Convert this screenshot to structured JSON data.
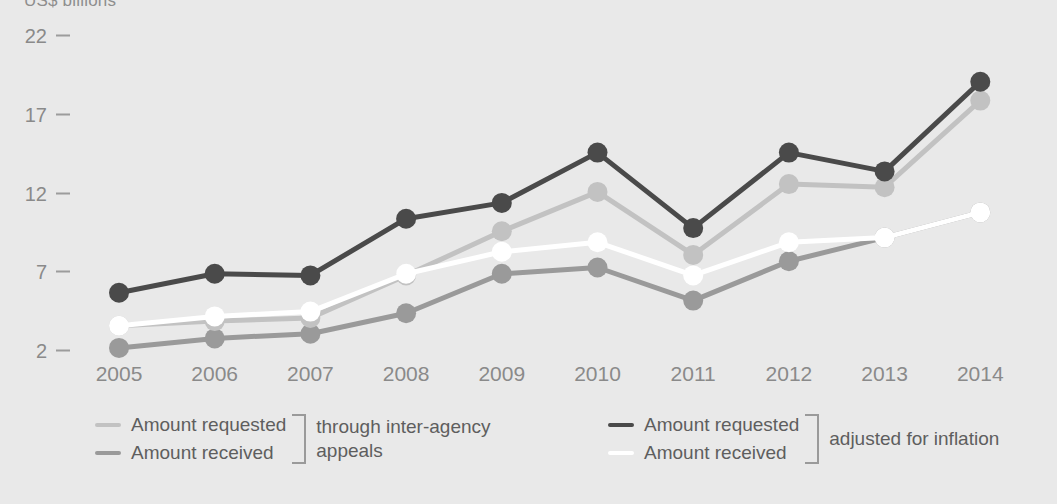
{
  "chart_data": {
    "type": "line",
    "title": "US$ billions",
    "xlabel": "",
    "ylabel": "US$ billions",
    "categories": [
      "2005",
      "2006",
      "2007",
      "2008",
      "2009",
      "2010",
      "2011",
      "2012",
      "2013",
      "2014"
    ],
    "x": [
      2005,
      2006,
      2007,
      2008,
      2009,
      2010,
      2011,
      2012,
      2013,
      2014
    ],
    "yticks": [
      2,
      7,
      12,
      17,
      22
    ],
    "ylim": [
      1.2,
      22.8
    ],
    "grid": false,
    "legend_position": "bottom",
    "series": [
      {
        "name": "Amount requested (adjusted for inflation)",
        "label": "Amount requested",
        "group": "adjusted for inflation",
        "color": "#4a4a4a",
        "values": [
          5.7,
          6.9,
          6.8,
          10.4,
          11.4,
          14.6,
          9.8,
          14.6,
          13.4,
          19.1
        ]
      },
      {
        "name": "Amount requested (through inter-agency appeals)",
        "label": "Amount requested",
        "group": "through inter-agency appeals",
        "color": "#c2c2c2",
        "values": [
          3.6,
          3.9,
          4.1,
          6.8,
          9.6,
          12.1,
          8.1,
          12.6,
          12.4,
          17.9
        ]
      },
      {
        "name": "Amount received (adjusted for inflation)",
        "label": "Amount received",
        "group": "adjusted for inflation",
        "color": "#ffffff",
        "values": [
          3.6,
          4.2,
          4.5,
          6.9,
          8.3,
          8.9,
          6.8,
          8.9,
          9.2,
          10.8
        ]
      },
      {
        "name": "Amount received (through inter-agency appeals)",
        "label": "Amount received",
        "group": "through inter-agency appeals",
        "color": "#9a9a9a",
        "values": [
          2.2,
          2.8,
          3.1,
          4.4,
          6.9,
          7.3,
          5.2,
          7.7,
          9.2,
          10.8
        ]
      }
    ]
  },
  "legend": {
    "left": {
      "rows": [
        {
          "label": "Amount requested",
          "color": "#c2c2c2"
        },
        {
          "label": "Amount received",
          "color": "#9a9a9a"
        }
      ],
      "bracket_label": "through inter-agency\nappeals"
    },
    "right": {
      "rows": [
        {
          "label": "Amount requested",
          "color": "#4a4a4a"
        },
        {
          "label": "Amount received",
          "color": "#ffffff"
        }
      ],
      "bracket_label": "adjusted for inflation"
    }
  },
  "colors": {
    "background": "#e9e9e9",
    "axis_text": "#8a8a8a",
    "legend_text": "#5e5e5e",
    "tick_mark": "#9c9c9c"
  }
}
